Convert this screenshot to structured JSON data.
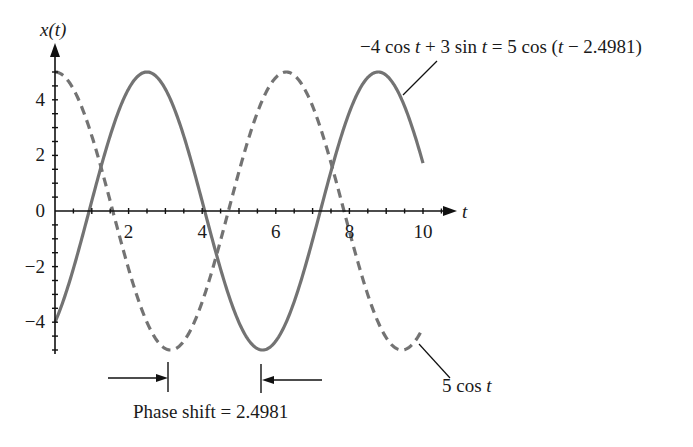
{
  "chart_data": {
    "type": "line",
    "title": "",
    "xlabel": "t",
    "ylabel": "x(t)",
    "xlim": [
      0,
      10
    ],
    "ylim": [
      -5,
      5
    ],
    "grid": false,
    "x_ticks": [
      2,
      4,
      6,
      8,
      10
    ],
    "x_tick_labels": [
      "2",
      "4",
      "6",
      "8",
      "10"
    ],
    "y_ticks": [
      -4,
      -2,
      0,
      2,
      4
    ],
    "y_tick_labels": [
      "−4",
      "−2",
      "0",
      "2",
      "4"
    ],
    "series": [
      {
        "name": "−4 cos t + 3 sin t = 5 cos (t − 2.4981)",
        "style": "solid",
        "amplitude": 5,
        "phase": 2.4981,
        "formula": "5*cos(t - 2.4981)",
        "t_range": [
          0,
          10
        ],
        "sample_points": {
          "t": [
            0,
            1,
            2,
            2.4981,
            3,
            4,
            5,
            5.6397,
            6,
            7,
            8,
            8.7813,
            9,
            10
          ],
          "x": [
            -4.0,
            0.36,
            4.39,
            5.0,
            4.37,
            0.36,
            -4.03,
            -5.0,
            -4.68,
            -1.0,
            3.47,
            5.0,
            4.88,
            1.73
          ]
        }
      },
      {
        "name": "5 cos t",
        "style": "dashed",
        "amplitude": 5,
        "phase": 0,
        "formula": "5*cos(t)",
        "t_range": [
          0,
          10
        ],
        "sample_points": {
          "t": [
            0,
            1,
            2,
            3,
            3.1416,
            4,
            5,
            6,
            6.2832,
            7,
            8,
            9,
            9.4248,
            10
          ],
          "x": [
            5.0,
            2.7,
            -2.08,
            -4.95,
            -5.0,
            -3.27,
            1.42,
            4.8,
            5.0,
            3.77,
            -0.73,
            -4.56,
            -5.0,
            -4.2
          ]
        }
      }
    ],
    "annotations": [
      {
        "text": "−4 cos t + 3 sin t = 5 cos (t − 2.4981)",
        "points_to": "solid curve"
      },
      {
        "text": "5 cos t",
        "points_to": "dashed curve"
      },
      {
        "text": "Phase shift = 2.4981",
        "between": [
          3.1416,
          5.6397
        ]
      }
    ]
  },
  "labels": {
    "y_axis": "x(t)",
    "x_axis": "t",
    "solid_curve_label_parts": [
      "−4 cos ",
      "t",
      " + 3 sin ",
      "t",
      " = 5 cos (",
      "t",
      " − 2.4981)"
    ],
    "dashed_curve_label_parts": [
      "5 cos ",
      "t"
    ],
    "phase_shift_label": "Phase shift = 2.4981"
  },
  "style": {
    "curve_color": "#737373",
    "axis_color": "#111111",
    "text_color": "#1a1a1a"
  }
}
